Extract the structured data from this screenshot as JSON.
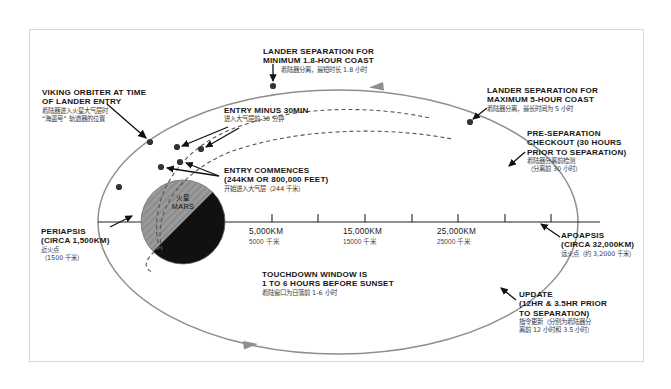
{
  "page": {
    "background": "#ffffff",
    "frame_border_color": "#d8d8d8",
    "orbit_color": "#8e8e8e",
    "entry_path_color": "#555555",
    "axis_color": "#222222",
    "marker_color": "#3a3a3a",
    "mars_light": "#8a8a8a",
    "mars_dark": "#111111"
  },
  "planet": {
    "name_cn": "火星",
    "name_en": "MARS"
  },
  "scale": {
    "ticks": [
      {
        "en": "5,000KM",
        "cn": "5000 千米"
      },
      {
        "en": "15,000KM",
        "cn": "15000 千米"
      },
      {
        "en": "25,000KM",
        "cn": "25000 千米"
      }
    ]
  },
  "annotations": {
    "viking_orbiter": {
      "en_lines": [
        "VIKING ORBITER AT TIME",
        "OF LANDER ENTRY"
      ],
      "cn_lines": [
        "着陆器进入火星大气层时",
        "“海盗号” 轨道器的位置"
      ]
    },
    "lander_sep_min": {
      "en_lines": [
        "LANDER SEPARATION FOR",
        "MINIMUM 1.8-HOUR COAST"
      ],
      "cn_lines": [
        "着陆器分离，最短时长 1.8 小时"
      ]
    },
    "entry_minus_30": {
      "en_lines": [
        "ENTRY MINUS 30MIN"
      ],
      "cn_lines": [
        "进入大气层前 30 分钟"
      ]
    },
    "entry_commences": {
      "en_lines": [
        "ENTRY COMMENCES",
        "(244KM OR 800,000 FEET)"
      ],
      "cn_lines": [
        "开始进入大气层（244 千米）"
      ]
    },
    "lander_sep_max": {
      "en_lines": [
        "LANDER SEPARATION FOR",
        "MAXIMUM 5-HOUR COAST"
      ],
      "cn_lines": [
        "着陆器分离，最长时间为 5 小时"
      ]
    },
    "pre_separation_checkout": {
      "en_lines": [
        "PRE-SEPARATION",
        "CHECKOUT (30 HOURS",
        "PRIOR TO SEPARATION)"
      ],
      "cn_lines": [
        "着陆器分离前检测",
        "（分离前 30 小时）"
      ]
    },
    "apoapsis": {
      "en_lines": [
        "APOAPSIS",
        "(CIRCA 32,000KM)"
      ],
      "cn_lines": [
        "远火点（约 3,2000 千米）"
      ]
    },
    "periapsis": {
      "en_lines": [
        "PERIAPSIS",
        "(CIRCA 1,500KM)"
      ],
      "cn_lines": [
        "近火点",
        "（1500 千米）"
      ]
    },
    "touchdown_window": {
      "en_lines": [
        "TOUCHDOWN WINDOW IS",
        "1 TO 6 HOURS BEFORE SUNSET"
      ],
      "cn_lines": [
        "着陆窗口为日落前 1-6 小时"
      ]
    },
    "update": {
      "en_lines": [
        "UPDATE",
        "(12HR & 3.5HR PRIOR",
        "TO SEPARATION)"
      ],
      "cn_lines": [
        "指令更新（分别为着陆器分",
        "离前 12 小时和 3.5 小时）"
      ]
    }
  }
}
